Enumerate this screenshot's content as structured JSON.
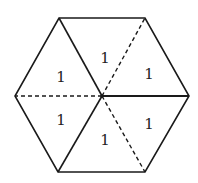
{
  "diagram": {
    "type": "hexagon-partition",
    "vertices": {
      "top_left": [
        59,
        18
      ],
      "top_right": [
        145,
        18
      ],
      "right": [
        189,
        96
      ],
      "bottom_right": [
        145,
        172
      ],
      "bottom_left": [
        58,
        172
      ],
      "left": [
        15,
        96
      ],
      "center": [
        102,
        96
      ]
    },
    "solid_spokes": [
      "top_left",
      "right",
      "bottom_left"
    ],
    "dashed_spokes": [
      "top_right",
      "left",
      "bottom_right"
    ],
    "labels": [
      {
        "text": "1",
        "x": 105,
        "y": 63
      },
      {
        "text": "1",
        "x": 149,
        "y": 79
      },
      {
        "text": "1",
        "x": 61,
        "y": 82
      },
      {
        "text": "1",
        "x": 61,
        "y": 125
      },
      {
        "text": "1",
        "x": 149,
        "y": 129
      },
      {
        "text": "1",
        "x": 105,
        "y": 145
      }
    ],
    "stroke_color": "#1a1a1a"
  }
}
